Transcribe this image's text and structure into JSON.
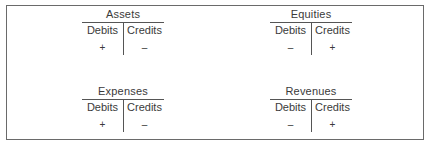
{
  "accounts": [
    {
      "title": "Assets",
      "debits_label": "Debits",
      "credits_label": "Credits",
      "debit_sign": "+",
      "credit_sign": "–"
    },
    {
      "title": "Equities",
      "debits_label": "Debits",
      "credits_label": "Credits",
      "debit_sign": "–",
      "credit_sign": "+"
    },
    {
      "title": "Expenses",
      "debits_label": "Debits",
      "credits_label": "Credits",
      "debit_sign": "+",
      "credit_sign": "–"
    },
    {
      "title": "Revenues",
      "debits_label": "Debits",
      "credits_label": "Credits",
      "debit_sign": "–",
      "credit_sign": "+"
    }
  ]
}
